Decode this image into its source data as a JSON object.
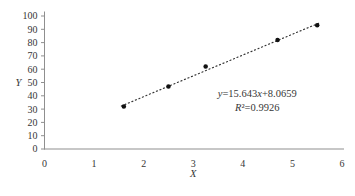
{
  "chart_data": {
    "type": "scatter",
    "title": "",
    "xlabel": "X",
    "ylabel": "Y",
    "xlim": [
      0,
      6
    ],
    "ylim": [
      0,
      100
    ],
    "x_ticks": [
      "0",
      "1",
      "2",
      "3",
      "4",
      "5",
      "6"
    ],
    "y_ticks": [
      "0",
      "10",
      "20",
      "30",
      "40",
      "50",
      "60",
      "70",
      "80",
      "90",
      "100"
    ],
    "grid": false,
    "legend": "none",
    "series": [
      {
        "name": "observations",
        "marker": "filled-circle",
        "x": [
          1.6,
          2.5,
          3.25,
          4.7,
          5.5
        ],
        "y": [
          32,
          47,
          62,
          82,
          93
        ]
      }
    ],
    "trendline": {
      "style": "dotted",
      "slope": 15.643,
      "intercept": 8.0659,
      "x_start": 1.55,
      "x_end": 5.55,
      "equation_label": "y=15.643x+8.0659",
      "r_squared_label": "R²=0.9926",
      "annotation_anchor": {
        "x": 4.29,
        "y_line1": 39,
        "y_line2": 28.5
      }
    },
    "colors": {
      "marker": "#111111",
      "trendline": "#333333",
      "axis": "#8f8f8f",
      "text": "#363636"
    }
  }
}
